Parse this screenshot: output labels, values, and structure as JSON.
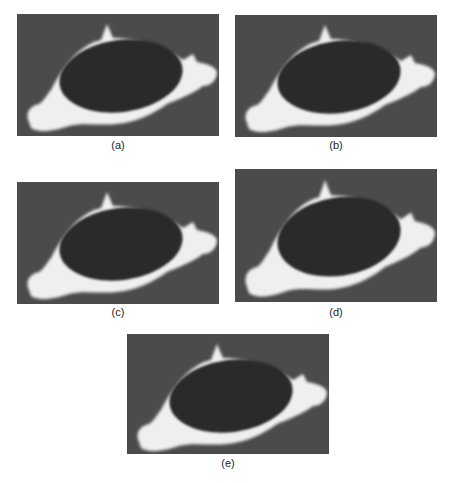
{
  "figure": {
    "panels": [
      {
        "id": "a",
        "label": "(a)"
      },
      {
        "id": "b",
        "label": "(b)"
      },
      {
        "id": "c",
        "label": "(c)"
      },
      {
        "id": "d",
        "label": "(d)"
      },
      {
        "id": "e",
        "label": "(e)"
      }
    ],
    "colors": {
      "background": "#4b4b4b",
      "cavity": "#2c2c2c",
      "bone": "#f4f4f4"
    }
  }
}
